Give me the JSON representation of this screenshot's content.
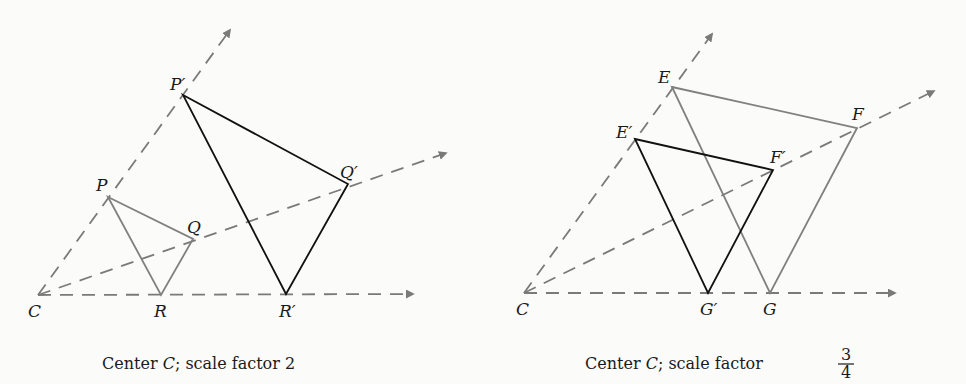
{
  "panels": [
    {
      "caption": {
        "prefix": "Center ",
        "center": "C",
        "suffix": "; scale factor 2"
      },
      "center_label": "C",
      "original": {
        "labels": [
          "P",
          "Q",
          "R"
        ]
      },
      "image": {
        "labels": [
          "P′",
          "Q′",
          "R′"
        ]
      },
      "scale_factor": "2"
    },
    {
      "caption": {
        "prefix": "Center ",
        "center": "C",
        "suffix": "; scale factor ",
        "num": "3",
        "den": "4"
      },
      "center_label": "C",
      "original": {
        "labels": [
          "E",
          "F",
          "G"
        ]
      },
      "image": {
        "labels": [
          "E′",
          "F′",
          "G′"
        ]
      },
      "scale_factor": "3/4"
    }
  ],
  "colors": {
    "original": "#808080",
    "image": "#111111",
    "rays": "#7a7a7a"
  }
}
